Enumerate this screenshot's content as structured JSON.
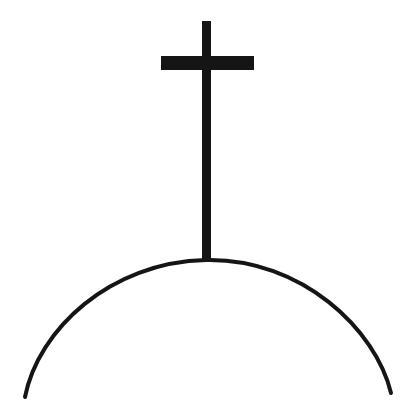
{
  "canvas": {
    "width": 420,
    "height": 403,
    "background_color": "#ffffff",
    "ink_color": "#151515",
    "title": "Cross on a Hill"
  },
  "chart_data": {
    "type": "line",
    "xlabel": "",
    "ylabel": "",
    "xlim": [
      0,
      420
    ],
    "ylim": [
      403,
      0
    ],
    "grid": false,
    "legend": "none",
    "annotations": [],
    "series": [
      {
        "name": "hill-arc",
        "shape": "arc",
        "stroke_color": "#151515",
        "stroke_width": 4,
        "fill": "none",
        "x": [
          25,
          50,
          85,
          110,
          150,
          207,
          260,
          300,
          340,
          370,
          390
        ],
        "y": [
          395,
          331,
          305,
          290,
          272,
          260,
          265,
          285,
          312,
          340,
          390
        ]
      },
      {
        "name": "cross-vertical-post",
        "shape": "rect",
        "fill_color": "#151515",
        "x": 202,
        "y": 21,
        "width": 9,
        "height": 240
      },
      {
        "name": "cross-horizontal-bar",
        "shape": "rect",
        "fill_color": "#151515",
        "x": 161,
        "y": 56,
        "width": 93,
        "height": 14
      }
    ]
  },
  "geometry": {
    "cross": {
      "post_x": 202,
      "post_top_y": 21,
      "post_width": 9,
      "post_bottom_y": 261,
      "bar_x": 161,
      "bar_y": 56,
      "bar_width": 93,
      "bar_height": 14,
      "center_x": 206.5
    },
    "hill": {
      "path": "M 25 397 C 38 330 110 262 206 260 C 302 258 376 330 391 393",
      "stroke_width": 4,
      "apex_x": 206,
      "apex_y": 260,
      "left_end_x": 25,
      "left_end_y": 397,
      "right_end_x": 391,
      "right_end_y": 393
    }
  }
}
